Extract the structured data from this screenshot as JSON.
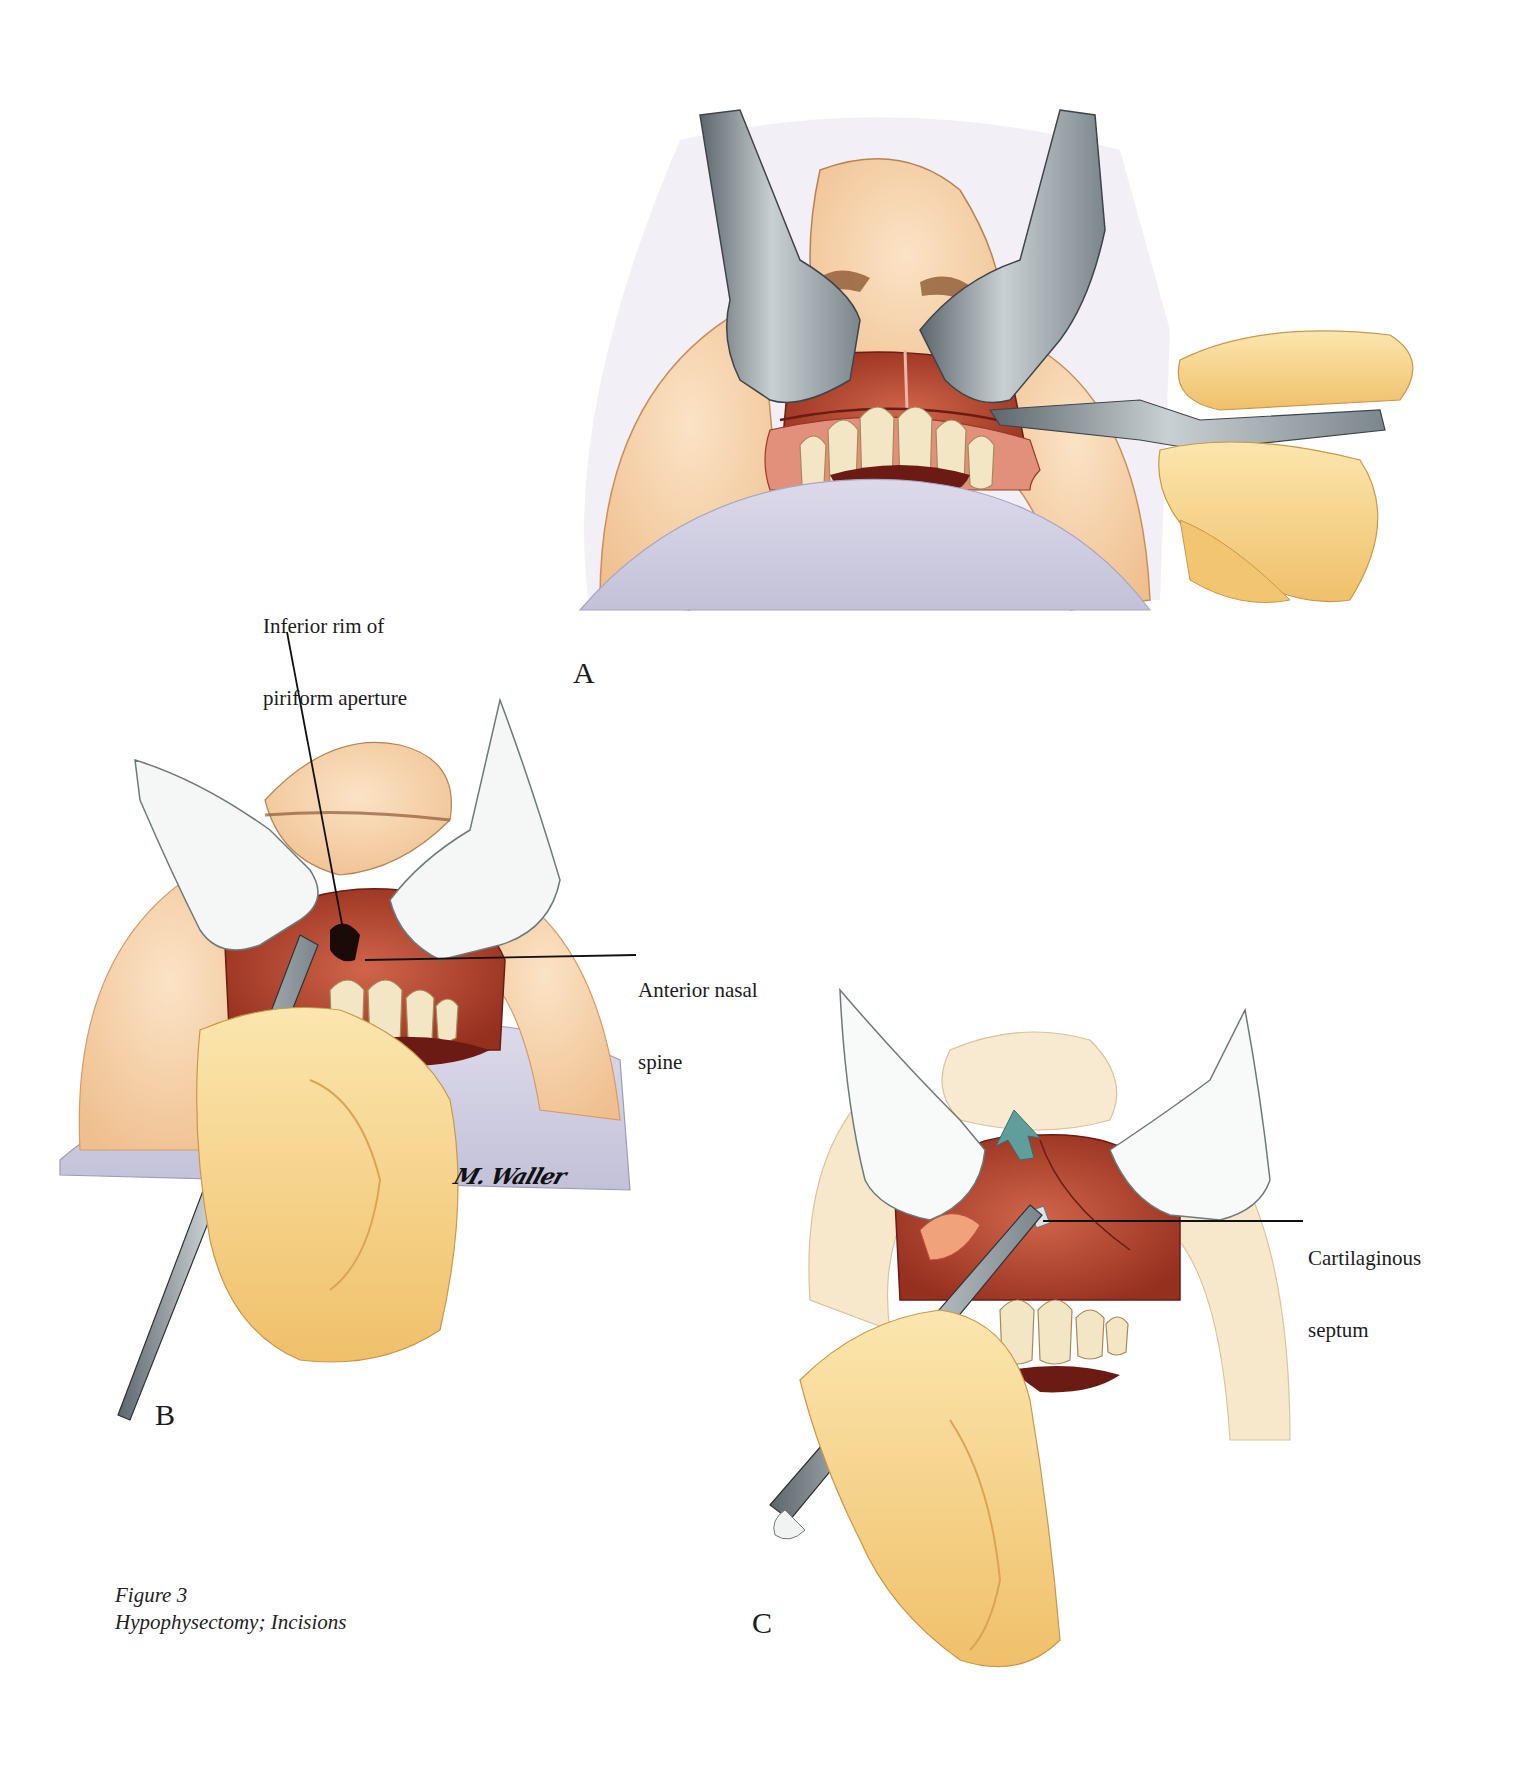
{
  "figure": {
    "caption": {
      "number": "Figure 3",
      "title": "Hypophysectomy; Incisions"
    },
    "signature": "M. Waller",
    "panels": [
      {
        "id": "A",
        "letter": "A",
        "description": "Upper lip retracted with retractors; scalpel making sublabial gingival incision above the upper teeth"
      },
      {
        "id": "B",
        "letter": "B",
        "description": "Elevator dissecting mucosa at the inferior rim of the piriform aperture"
      },
      {
        "id": "C",
        "letter": "C",
        "description": "Elevator advanced along cartilaginous septum with directional arrow"
      }
    ],
    "annotations": [
      {
        "panel": "B",
        "line1": "Inferior rim of",
        "line2": "piriform aperture"
      },
      {
        "panel": "B",
        "line1": "Anterior nasal",
        "line2": "spine"
      },
      {
        "panel": "C",
        "line1": "Cartilaginous",
        "line2": "septum"
      }
    ],
    "colors": {
      "skin": "#f4cfa6",
      "skin_shadow": "#e8b07a",
      "mucosa": "#b8432c",
      "mucosa_dark": "#8e2a1a",
      "gum": "#e08a76",
      "teeth": "#f3e6c4",
      "steel": "#9aa3a8",
      "steel_dark": "#5c666c",
      "drape": "#cfcde0",
      "glove": "#f7d895",
      "arrow": "#5f9e9a"
    }
  }
}
